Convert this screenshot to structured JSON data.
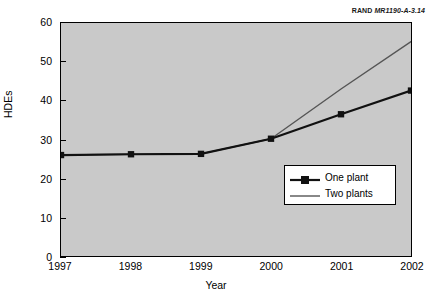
{
  "figure": {
    "source_brand": "RAND",
    "source_id": "MR1190-A-3.14"
  },
  "chart_data": {
    "type": "line",
    "title": "",
    "subtitle": "",
    "xlabel": "Year",
    "ylabel": "HDEs",
    "categories": [
      "1997",
      "1998",
      "1999",
      "2000",
      "2001",
      "2002"
    ],
    "x": [
      1997,
      1998,
      1999,
      2000,
      2001,
      2002
    ],
    "xlim": [
      1997,
      2002
    ],
    "ylim": [
      0,
      60
    ],
    "yticks": [
      "0",
      "10",
      "20",
      "30",
      "40",
      "50",
      "60"
    ],
    "ytick_values": [
      0,
      10,
      20,
      30,
      40,
      50,
      60
    ],
    "xticks": [
      "1997",
      "1998",
      "1999",
      "2000",
      "2001",
      "2002"
    ],
    "grid": false,
    "legend_position": "inside-right-middle",
    "plot_background": "#c9c9c9",
    "series": [
      {
        "name": "One plant",
        "values": [
          26,
          26.2,
          26.3,
          30.2,
          36.5,
          42.6
        ],
        "color": "#111111",
        "marker": "square",
        "line_width": 2.2
      },
      {
        "name": "Two plants",
        "values": [
          26,
          26.2,
          26.3,
          30.2,
          43.0,
          55.2
        ],
        "color": "#555555",
        "marker": "none",
        "line_width": 1.4
      }
    ],
    "legend": [
      "One plant",
      "Two plants"
    ]
  }
}
